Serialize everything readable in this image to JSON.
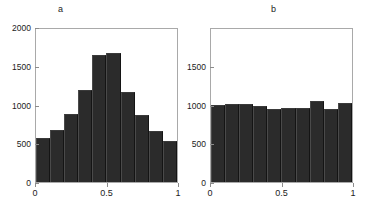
{
  "chart_data": [
    {
      "type": "bar",
      "title": "a",
      "xlabel": "",
      "ylabel": "",
      "xlim": [
        0,
        1
      ],
      "ylim": [
        0,
        2000
      ],
      "grid": false,
      "legend": null,
      "xticks": [
        "0",
        "0.5",
        "1"
      ],
      "xtick_values": [
        0,
        0.5,
        1
      ],
      "yticks": [
        "0",
        "500",
        "1000",
        "1500",
        "2000"
      ],
      "ytick_values": [
        0,
        500,
        1000,
        1500,
        2000
      ],
      "bin_edges": [
        0,
        0.1,
        0.2,
        0.3,
        0.4,
        0.5,
        0.6,
        0.7,
        0.8,
        0.9,
        1
      ],
      "categories": [
        "0-0.1",
        "0.1-0.2",
        "0.2-0.3",
        "0.3-0.4",
        "0.4-0.5",
        "0.5-0.6",
        "0.6-0.7",
        "0.7-0.8",
        "0.8-0.9",
        "0.9-1"
      ],
      "values": [
        580,
        680,
        890,
        1205,
        1655,
        1680,
        1175,
        870,
        670,
        540
      ],
      "bar_color": "#2b2b2b"
    },
    {
      "type": "bar",
      "title": "b",
      "xlabel": "",
      "ylabel": "",
      "xlim": [
        0,
        1
      ],
      "ylim": [
        0,
        2000
      ],
      "grid": false,
      "legend": null,
      "xticks": [
        "0",
        "0.5",
        "1"
      ],
      "xtick_values": [
        0,
        0.5,
        1
      ],
      "yticks": [
        "0",
        "500",
        "1000",
        "1500"
      ],
      "ytick_values": [
        0,
        500,
        1000,
        1500
      ],
      "bin_edges": [
        0,
        0.1,
        0.2,
        0.3,
        0.4,
        0.5,
        0.6,
        0.7,
        0.8,
        0.9,
        1
      ],
      "categories": [
        "0-0.1",
        "0.1-0.2",
        "0.2-0.3",
        "0.3-0.4",
        "0.4-0.5",
        "0.5-0.6",
        "0.6-0.7",
        "0.7-0.8",
        "0.8-0.9",
        "0.9-1"
      ],
      "values": [
        1005,
        1020,
        1015,
        995,
        960,
        970,
        970,
        1060,
        960,
        1030
      ],
      "bar_color": "#2b2b2b"
    }
  ]
}
